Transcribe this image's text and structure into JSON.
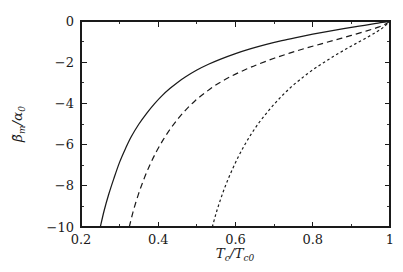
{
  "chart_data": {
    "type": "line",
    "title": "",
    "xlabel": "T_c/T_c0",
    "ylabel": "beta_m_tilde/alpha_0",
    "xlim": [
      0.2,
      1.0
    ],
    "ylim": [
      -10,
      0
    ],
    "grid": false,
    "legend": "none",
    "background": "#ffffff",
    "foreground": "#1a1a1a",
    "x_ticks": [
      {
        "value": 0.2,
        "label": "0.2"
      },
      {
        "value": 0.4,
        "label": "0.4"
      },
      {
        "value": 0.6,
        "label": "0.6"
      },
      {
        "value": 0.8,
        "label": "0.8"
      },
      {
        "value": 1.0,
        "label": "1"
      }
    ],
    "x_minor_ticks": [
      0.3,
      0.5,
      0.7,
      0.9
    ],
    "y_ticks": [
      {
        "value": 0,
        "label": "0"
      },
      {
        "value": -2,
        "label": "−2"
      },
      {
        "value": -4,
        "label": "−4"
      },
      {
        "value": -6,
        "label": "−6"
      },
      {
        "value": -8,
        "label": "−8"
      },
      {
        "value": -10,
        "label": "−10"
      }
    ],
    "y_minor_ticks": [
      -1,
      -3,
      -5,
      -7,
      -9
    ],
    "series": [
      {
        "name": "curve-1",
        "style": "solid",
        "dash": "none",
        "color": "#1a1a1a",
        "width": 1.25,
        "x": [
          0.25,
          0.26,
          0.272,
          0.285,
          0.3,
          0.315,
          0.33,
          0.35,
          0.37,
          0.39,
          0.41,
          0.43,
          0.45,
          0.47,
          0.5,
          0.53,
          0.56,
          0.6,
          0.64,
          0.68,
          0.72,
          0.76,
          0.8,
          0.84,
          0.88,
          0.92,
          0.96,
          0.98,
          1.0
        ],
        "y": [
          -10.0,
          -9.2,
          -8.4,
          -7.65,
          -6.85,
          -6.2,
          -5.62,
          -5.0,
          -4.48,
          -4.02,
          -3.62,
          -3.28,
          -2.98,
          -2.72,
          -2.38,
          -2.1,
          -1.86,
          -1.58,
          -1.34,
          -1.13,
          -0.95,
          -0.79,
          -0.64,
          -0.5,
          -0.37,
          -0.25,
          -0.13,
          -0.07,
          0.0
        ]
      },
      {
        "name": "curve-2",
        "style": "dashed",
        "dash": "6,4",
        "color": "#1a1a1a",
        "width": 1.2,
        "x": [
          0.325,
          0.335,
          0.348,
          0.362,
          0.378,
          0.395,
          0.413,
          0.432,
          0.452,
          0.472,
          0.495,
          0.52,
          0.545,
          0.572,
          0.6,
          0.63,
          0.66,
          0.7,
          0.74,
          0.78,
          0.82,
          0.86,
          0.9,
          0.94,
          0.97,
          0.99,
          1.0
        ],
        "y": [
          -10.0,
          -9.25,
          -8.45,
          -7.72,
          -7.0,
          -6.35,
          -5.76,
          -5.22,
          -4.73,
          -4.3,
          -3.88,
          -3.5,
          -3.16,
          -2.85,
          -2.58,
          -2.32,
          -2.09,
          -1.81,
          -1.56,
          -1.33,
          -1.12,
          -0.91,
          -0.7,
          -0.48,
          -0.3,
          -0.13,
          0.0
        ]
      },
      {
        "name": "curve-3",
        "style": "dotted",
        "dash": "2.6,2.6",
        "color": "#1a1a1a",
        "width": 1.2,
        "x": [
          0.54,
          0.55,
          0.562,
          0.575,
          0.59,
          0.606,
          0.623,
          0.641,
          0.66,
          0.68,
          0.7,
          0.721,
          0.743,
          0.766,
          0.79,
          0.815,
          0.84,
          0.866,
          0.892,
          0.918,
          0.944,
          0.966,
          0.984,
          1.0
        ],
        "y": [
          -10.0,
          -9.32,
          -8.62,
          -7.95,
          -7.28,
          -6.64,
          -6.04,
          -5.48,
          -4.96,
          -4.48,
          -4.04,
          -3.62,
          -3.22,
          -2.86,
          -2.51,
          -2.18,
          -1.88,
          -1.58,
          -1.3,
          -1.03,
          -0.76,
          -0.52,
          -0.29,
          0.0
        ]
      }
    ]
  },
  "axes": {
    "x_title_parts": {
      "main": "T",
      "sub1": "c",
      "slash": "/",
      "main2": "T",
      "sub2": "c0"
    },
    "y_title_parts": {
      "beta": "β̃",
      "subm": "m",
      "slash": "/",
      "alpha": "α",
      "sub0": "0"
    }
  }
}
